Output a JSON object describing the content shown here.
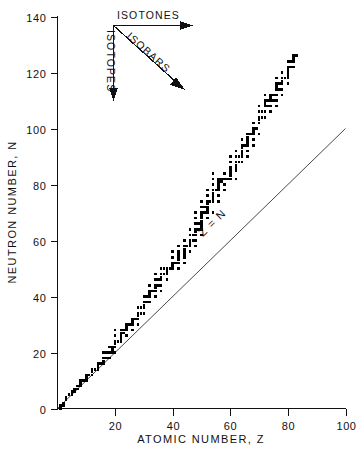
{
  "chart_data": {
    "type": "scatter",
    "title": "",
    "subtitle": "",
    "xlabel": "ATOMIC NUMBER, Z",
    "ylabel": "NEUTRON NUMBER, N",
    "xlim": [
      0,
      100
    ],
    "ylim": [
      0,
      140
    ],
    "xticks": [
      0,
      20,
      40,
      60,
      80,
      100
    ],
    "yticks": [
      0,
      20,
      40,
      60,
      80,
      100,
      120,
      140
    ],
    "xtick_labels": [
      "0",
      "20",
      "40",
      "60",
      "80",
      "100"
    ],
    "ytick_labels": [
      "0",
      "20",
      "40",
      "60",
      "80",
      "100",
      "120",
      "140"
    ],
    "grid": false,
    "legend": "none",
    "marker": "square",
    "marker_color": "#000000",
    "series": [
      {
        "name": "stable nuclides",
        "x": [
          1,
          1,
          2,
          2,
          3,
          3,
          4,
          5,
          5,
          6,
          6,
          7,
          7,
          8,
          8,
          8,
          9,
          10,
          10,
          10,
          11,
          12,
          12,
          12,
          13,
          14,
          14,
          14,
          15,
          16,
          16,
          16,
          16,
          17,
          17,
          18,
          18,
          18,
          19,
          19,
          19,
          20,
          20,
          20,
          20,
          20,
          20,
          21,
          22,
          22,
          22,
          22,
          22,
          23,
          23,
          24,
          24,
          24,
          24,
          25,
          26,
          26,
          26,
          26,
          27,
          28,
          28,
          28,
          28,
          28,
          29,
          29,
          30,
          30,
          30,
          30,
          30,
          31,
          31,
          32,
          32,
          32,
          32,
          32,
          33,
          34,
          34,
          34,
          34,
          34,
          34,
          35,
          35,
          36,
          36,
          36,
          36,
          36,
          36,
          37,
          37,
          38,
          38,
          38,
          38,
          39,
          40,
          40,
          40,
          40,
          40,
          41,
          42,
          42,
          42,
          42,
          42,
          42,
          42,
          44,
          44,
          44,
          44,
          44,
          44,
          44,
          45,
          46,
          46,
          46,
          46,
          46,
          46,
          47,
          47,
          48,
          48,
          48,
          48,
          48,
          48,
          48,
          48,
          49,
          49,
          50,
          50,
          50,
          50,
          50,
          50,
          50,
          50,
          50,
          50,
          51,
          51,
          52,
          52,
          52,
          52,
          52,
          52,
          52,
          52,
          53,
          54,
          54,
          54,
          54,
          54,
          54,
          54,
          54,
          54,
          55,
          56,
          56,
          56,
          56,
          56,
          56,
          56,
          57,
          57,
          58,
          58,
          58,
          58,
          59,
          60,
          60,
          60,
          60,
          60,
          60,
          60,
          62,
          62,
          62,
          62,
          62,
          62,
          62,
          63,
          63,
          64,
          64,
          64,
          64,
          64,
          64,
          64,
          65,
          66,
          66,
          66,
          66,
          66,
          66,
          66,
          67,
          68,
          68,
          68,
          68,
          68,
          68,
          69,
          70,
          70,
          70,
          70,
          70,
          70,
          70,
          71,
          71,
          72,
          72,
          72,
          72,
          72,
          72,
          73,
          73,
          74,
          74,
          74,
          74,
          74,
          75,
          75,
          76,
          76,
          76,
          76,
          76,
          76,
          76,
          77,
          77,
          78,
          78,
          78,
          78,
          78,
          78,
          79,
          80,
          80,
          80,
          80,
          80,
          80,
          80,
          81,
          81,
          82,
          82,
          82,
          82,
          83
        ],
        "y": [
          0,
          1,
          1,
          2,
          3,
          4,
          5,
          5,
          6,
          6,
          7,
          7,
          8,
          8,
          9,
          10,
          10,
          10,
          11,
          12,
          12,
          12,
          13,
          14,
          14,
          14,
          15,
          16,
          16,
          16,
          17,
          18,
          20,
          18,
          20,
          18,
          20,
          22,
          20,
          21,
          22,
          20,
          22,
          23,
          24,
          26,
          28,
          24,
          24,
          25,
          26,
          27,
          28,
          27,
          28,
          26,
          28,
          29,
          30,
          30,
          28,
          30,
          31,
          32,
          32,
          30,
          32,
          33,
          34,
          36,
          34,
          36,
          34,
          36,
          37,
          38,
          40,
          38,
          40,
          38,
          40,
          41,
          42,
          44,
          42,
          40,
          42,
          43,
          44,
          46,
          48,
          44,
          46,
          42,
          44,
          46,
          47,
          48,
          50,
          48,
          50,
          46,
          48,
          49,
          50,
          50,
          50,
          51,
          52,
          54,
          56,
          52,
          50,
          52,
          53,
          54,
          55,
          56,
          58,
          52,
          54,
          55,
          56,
          57,
          58,
          60,
          58,
          56,
          58,
          59,
          60,
          62,
          64,
          60,
          62,
          58,
          60,
          62,
          63,
          64,
          66,
          68,
          70,
          64,
          66,
          62,
          64,
          65,
          66,
          67,
          68,
          69,
          70,
          72,
          74,
          70,
          72,
          68,
          70,
          71,
          72,
          73,
          74,
          76,
          78,
          74,
          70,
          74,
          75,
          76,
          77,
          78,
          80,
          82,
          84,
          78,
          74,
          76,
          78,
          79,
          80,
          81,
          82,
          81,
          82,
          78,
          80,
          82,
          84,
          82,
          82,
          83,
          84,
          85,
          86,
          88,
          90,
          82,
          85,
          86,
          87,
          88,
          90,
          92,
          88,
          90,
          88,
          90,
          91,
          92,
          93,
          94,
          96,
          94,
          90,
          92,
          94,
          95,
          96,
          97,
          98,
          98,
          94,
          96,
          98,
          99,
          100,
          102,
          100,
          98,
          102,
          103,
          104,
          106,
          106,
          108,
          104,
          106,
          104,
          106,
          108,
          109,
          110,
          112,
          108,
          110,
          106,
          108,
          110,
          111,
          112,
          110,
          112,
          108,
          110,
          112,
          114,
          115,
          116,
          118,
          114,
          116,
          112,
          114,
          116,
          117,
          118,
          120,
          118,
          116,
          118,
          119,
          120,
          121,
          122,
          124,
          122,
          124,
          124,
          125,
          126,
          122,
          126
        ]
      }
    ],
    "reference_lines": [
      {
        "name": "Z = N",
        "label": "Z = N",
        "from": [
          0,
          0
        ],
        "to": [
          100,
          100
        ],
        "color": "#333333"
      }
    ],
    "annotations": [
      {
        "name": "isotones",
        "label": "ISOTONES",
        "direction": "right"
      },
      {
        "name": "isotopes",
        "label": "ISOTOPES",
        "direction": "down"
      },
      {
        "name": "isobars",
        "label": "ISOBARS",
        "direction": "down-right"
      }
    ]
  }
}
